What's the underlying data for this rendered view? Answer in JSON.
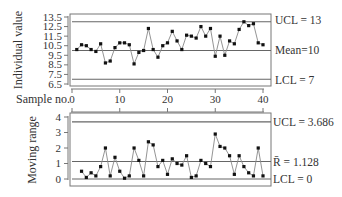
{
  "chart_data": [
    {
      "type": "line",
      "title": "Individuals chart",
      "xlabel": "Sample no.",
      "ylabel": "Individual value",
      "ylim": [
        6.5,
        13.5
      ],
      "yticks": [
        "13.5",
        "12.5",
        "11.5",
        "10.5",
        "9.5",
        "8.5",
        "7.5",
        "6.5"
      ],
      "xticks": [
        "0",
        "10",
        "20",
        "30",
        "40"
      ],
      "xlim": [
        0,
        40
      ],
      "control_lines": {
        "ucl": {
          "value": 13,
          "label": "UCL = 13"
        },
        "center": {
          "value": 10,
          "label": "Mean=10"
        },
        "lcl": {
          "value": 7,
          "label": "LCL = 7"
        }
      },
      "x": [
        1,
        2,
        3,
        4,
        5,
        6,
        7,
        8,
        9,
        10,
        11,
        12,
        13,
        14,
        15,
        16,
        17,
        18,
        19,
        20,
        21,
        22,
        23,
        24,
        25,
        26,
        27,
        28,
        29,
        30,
        31,
        32,
        33,
        34,
        35,
        36,
        37,
        38,
        39,
        40
      ],
      "values": [
        10.1,
        10.6,
        10.5,
        10.1,
        9.9,
        10.7,
        8.7,
        8.9,
        10.3,
        10.8,
        10.8,
        10.6,
        8.6,
        9.8,
        10.0,
        12.3,
        10.1,
        9.3,
        10.5,
        10.8,
        12.0,
        11.0,
        10.1,
        11.6,
        11.5,
        11.3,
        12.5,
        11.5,
        12.3,
        9.4,
        11.5,
        9.5,
        11.0,
        10.7,
        12.2,
        13.0,
        12.6,
        12.8,
        10.8,
        10.6
      ],
      "grid": false
    },
    {
      "type": "line",
      "title": "Moving range chart",
      "xlabel": "",
      "ylabel": "Moving range",
      "ylim": [
        0,
        4
      ],
      "yticks": [
        "4",
        "3",
        "2",
        "1",
        "0"
      ],
      "xticks": [
        "0",
        "10",
        "20",
        "30",
        "40"
      ],
      "xlim": [
        0,
        40
      ],
      "control_lines": {
        "ucl": {
          "value": 3.686,
          "label": "UCL = 3.686"
        },
        "center": {
          "value": 1.128,
          "label": "R̄ = 1.128"
        },
        "lcl": {
          "value": 0,
          "label": "LCL = 0"
        }
      },
      "x": [
        2,
        3,
        4,
        5,
        6,
        7,
        8,
        9,
        10,
        11,
        12,
        13,
        14,
        15,
        16,
        17,
        18,
        19,
        20,
        21,
        22,
        23,
        24,
        25,
        26,
        27,
        28,
        29,
        30,
        31,
        32,
        33,
        34,
        35,
        36,
        37,
        38,
        39,
        40
      ],
      "values": [
        0.5,
        0.1,
        0.4,
        0.2,
        0.8,
        2.0,
        0.2,
        1.4,
        0.5,
        0.05,
        0.2,
        2.0,
        1.2,
        0.2,
        2.4,
        2.2,
        0.8,
        1.2,
        0.3,
        1.3,
        1.0,
        0.9,
        1.5,
        0.1,
        0.2,
        1.2,
        1.0,
        0.8,
        2.9,
        2.1,
        2.0,
        1.5,
        0.3,
        1.5,
        0.8,
        0.4,
        0.2,
        2.0,
        0.2
      ],
      "grid": false
    }
  ],
  "labels": {
    "top_ylabel": "Individual value",
    "bottom_ylabel": "Moving range",
    "xlabel": "Sample no.",
    "top_ucl": "UCL = 13",
    "top_mean": "Mean=10",
    "top_lcl": "LCL = 7",
    "bot_ucl": "UCL = 3.686",
    "bot_rbar": "R̄ = 1.128",
    "bot_lcl": "LCL = 0"
  }
}
